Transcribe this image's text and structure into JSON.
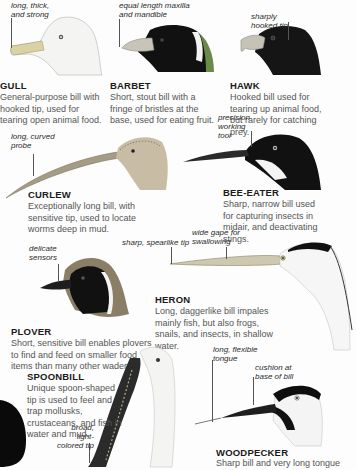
{
  "birds": [
    {
      "id": "gull",
      "name": "GULL",
      "annotation": "long, thick, and strong",
      "description": "General-purpose bill with hooked tip, used for tearing open animal food."
    },
    {
      "id": "barbet",
      "name": "BARBET",
      "annotation": "equal length maxilla and mandible",
      "description": "Short, stout bill with a fringe of bristles at the base, used for eating fruit."
    },
    {
      "id": "hawk",
      "name": "HAWK",
      "annotation": "sharply hooked tip",
      "description": "Hooked bill used for tearing up animal food, but rarely for catching prey."
    },
    {
      "id": "curlew",
      "name": "CURLEW",
      "annotation": "long, curved probe",
      "description": "Exceptionally long bill, with sensitive tip, used to locate worms deep in mud."
    },
    {
      "id": "bee-eater",
      "name": "BEE-EATER",
      "annotation": "precision working tool",
      "description": "Sharp, narrow bill used for capturing insects in midair, and deactivating stings."
    },
    {
      "id": "heron",
      "name": "HERON",
      "annotations": [
        "sharp, spearlike tip",
        "wide gape for swallowing"
      ],
      "description": "Long, daggerlike bill impales mainly fish, but also frogs, snails, and insects, in shallow water."
    },
    {
      "id": "plover",
      "name": "PLOVER",
      "annotation": "delicate sensors",
      "description": "Short, sensitive bill enables plovers to find and feed on smaller food items than many other waders."
    },
    {
      "id": "spoonbill",
      "name": "SPOONBILL",
      "annotation": "broad, light-colored tip",
      "description": "Unique spoon-shaped tip is used to feel and trap mollusks, crustaceans, and fish in water and mud."
    },
    {
      "id": "woodpecker",
      "name": "WOODPECKER",
      "annotations": [
        "long, flexible tongue",
        "cushion at base of bill"
      ],
      "description": "Sharp bill and very long tongue"
    }
  ],
  "colors": {
    "text": "#555555",
    "heading": "#1a1a1a",
    "background": "#fdfdfd"
  }
}
